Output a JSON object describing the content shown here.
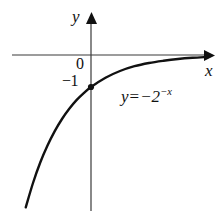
{
  "figure": {
    "background_color": "#ffffff",
    "width": 223,
    "height": 216
  },
  "axes": {
    "x_axis_label": "x",
    "y_axis_label": "y",
    "axis_color": "#3a3a3a",
    "origin_label": "0",
    "y_intercept_label": "−1"
  },
  "equation": {
    "lhs": "y",
    "operator": "=",
    "base": "−2",
    "exponent": "−x",
    "full_text": "y = −2^(−x)"
  },
  "chart_data": {
    "type": "line",
    "xlabel": "x",
    "ylabel": "y",
    "xlim": [
      -4.2,
      4.2
    ],
    "ylim": [
      -16,
      1.2
    ],
    "grid": false,
    "legend": null,
    "curve_color": "#111111",
    "annotations": [
      {
        "text": "0",
        "x": 0,
        "y": 0,
        "role": "origin-tick"
      },
      {
        "text": "−1",
        "x": 0,
        "y": -1,
        "role": "y-intercept-tick"
      },
      {
        "text": "y = −2^(−x)",
        "x": 1.2,
        "y": -2.3,
        "role": "curve-equation"
      }
    ],
    "marked_points": [
      {
        "x": 0,
        "y": -1,
        "label": "y-intercept",
        "style": "filled-dot"
      }
    ],
    "series": [
      {
        "name": "y = -2^(-x)",
        "x": [
          -4.0,
          -3.75,
          -3.5,
          -3.25,
          -3.0,
          -2.75,
          -2.5,
          -2.25,
          -2.0,
          -1.75,
          -1.5,
          -1.25,
          -1.0,
          -0.75,
          -0.5,
          -0.25,
          0.0,
          0.5,
          1.0,
          1.5,
          2.0,
          2.5,
          3.0,
          3.5,
          4.0
        ],
        "y": [
          -16.0,
          -13.45,
          -11.31,
          -9.51,
          -8.0,
          -6.73,
          -5.66,
          -4.76,
          -4.0,
          -3.36,
          -2.83,
          -2.38,
          -2.0,
          -1.68,
          -1.41,
          -1.19,
          -1.0,
          -0.71,
          -0.5,
          -0.35,
          -0.25,
          -0.18,
          -0.125,
          -0.088,
          -0.0625
        ]
      }
    ],
    "asymptote": {
      "type": "horizontal",
      "value": 0,
      "description": "y = 0 (the x-axis)"
    }
  }
}
